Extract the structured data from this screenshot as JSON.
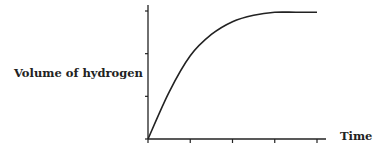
{
  "chart_data": {
    "type": "line",
    "title": "",
    "xlabel": "Time",
    "ylabel": "Volume of hydrogen",
    "x_ticks": 5,
    "y_ticks": 4,
    "tick_labels": false,
    "grid": false,
    "legend": null,
    "series": [
      {
        "name": "Volume of hydrogen",
        "x": [
          0,
          0.5,
          1,
          1.5,
          2,
          2.5,
          3,
          3.5,
          4
        ],
        "y": [
          0,
          1.1,
          1.95,
          2.45,
          2.75,
          2.9,
          2.97,
          2.97,
          2.97
        ]
      }
    ],
    "xlim": [
      0,
      4
    ],
    "ylim": [
      0,
      3
    ],
    "annotations": [
      "curve rises steeply then levels off (plateau)"
    ]
  },
  "labels": {
    "y_axis": "Volume of hydrogen",
    "x_axis": "Time"
  }
}
